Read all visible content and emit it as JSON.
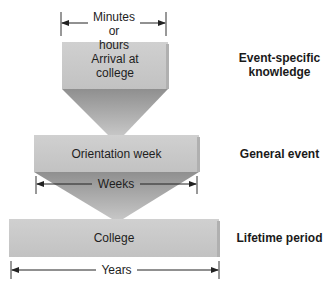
{
  "levels": [
    {
      "box_label": "Arrival at college",
      "box_line1": "Arrival at",
      "box_line2": "college",
      "side_label_line1": "Event-specific",
      "side_label_line2": "knowledge",
      "duration": "Minutes or hours",
      "duration_line1": "Minutes or",
      "duration_line2": "hours"
    },
    {
      "box_label": "Orientation week",
      "side_label": "General event",
      "duration": "Weeks"
    },
    {
      "box_label": "College",
      "side_label": "Lifetime period",
      "duration": "Years"
    }
  ],
  "colors": {
    "box": "#c9c9c9",
    "box_shadow": "#a8a8a8",
    "funnel_top": "#9a9a9a",
    "funnel_bottom": "#c4c4c4",
    "arrow": "#222222"
  }
}
